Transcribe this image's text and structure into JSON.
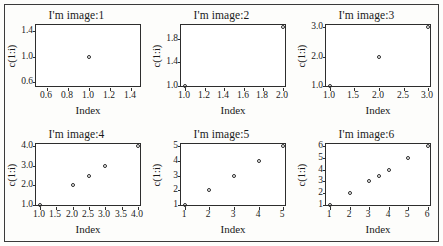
{
  "figure": {
    "background_color": "#fdfdfb",
    "border_color": "#3a3a3a",
    "axis_color": "#2d2d2d",
    "point_color": "#2b2b2b",
    "layout": "2 rows x 3 columns",
    "marker": "open-circle"
  },
  "chart_data": [
    {
      "type": "scatter",
      "title": "I'm image:1",
      "xlabel": "Index",
      "ylabel": "c(1:i)",
      "x": [
        1
      ],
      "y": [
        1
      ],
      "xlim": [
        0.5,
        1.5
      ],
      "ylim": [
        0.5,
        1.5
      ],
      "xticks": [
        "0.6",
        "0.8",
        "1.0",
        "1.2",
        "1.4"
      ],
      "xtick_values": [
        0.6,
        0.8,
        1.0,
        1.2,
        1.4
      ],
      "yticks": [
        "0.6",
        "1.0",
        "1.4"
      ],
      "ytick_values": [
        0.6,
        1.0,
        1.4
      ],
      "grid": false,
      "legend": "none"
    },
    {
      "type": "scatter",
      "title": "I'm image:2",
      "xlabel": "Index",
      "ylabel": "c(1:i)",
      "x": [
        1,
        2
      ],
      "y": [
        1,
        2
      ],
      "xlim": [
        0.96,
        2.04
      ],
      "ylim": [
        0.96,
        2.04
      ],
      "xticks": [
        "1.0",
        "1.2",
        "1.4",
        "1.6",
        "1.8",
        "2.0"
      ],
      "xtick_values": [
        1.0,
        1.2,
        1.4,
        1.6,
        1.8,
        2.0
      ],
      "yticks": [
        "1.0",
        "1.4",
        "1.8"
      ],
      "ytick_values": [
        1.0,
        1.4,
        1.8
      ],
      "grid": false,
      "legend": "none"
    },
    {
      "type": "scatter",
      "title": "I'm image:3",
      "xlabel": "Index",
      "ylabel": "c(1:i)",
      "x": [
        1,
        2,
        3
      ],
      "y": [
        1,
        2,
        3
      ],
      "xlim": [
        0.92,
        3.08
      ],
      "ylim": [
        0.92,
        3.08
      ],
      "xticks": [
        "1.0",
        "1.5",
        "2.0",
        "2.5",
        "3.0"
      ],
      "xtick_values": [
        1.0,
        1.5,
        2.0,
        2.5,
        3.0
      ],
      "yticks": [
        "1.0",
        "2.0",
        "3.0"
      ],
      "ytick_values": [
        1.0,
        2.0,
        3.0
      ],
      "grid": false,
      "legend": "none"
    },
    {
      "type": "scatter",
      "title": "I'm image:4",
      "xlabel": "Index",
      "ylabel": "c(1:i)",
      "x": [
        1,
        2,
        2.5,
        3,
        4
      ],
      "y": [
        1,
        2,
        2.5,
        3,
        4
      ],
      "xlim": [
        0.88,
        4.12
      ],
      "ylim": [
        0.88,
        4.12
      ],
      "xticks": [
        "1.0",
        "1.5",
        "2.0",
        "2.5",
        "3.0",
        "3.5",
        "4.0"
      ],
      "xtick_values": [
        1.0,
        1.5,
        2.0,
        2.5,
        3.0,
        3.5,
        4.0
      ],
      "yticks": [
        "1.0",
        "2.0",
        "3.0",
        "4.0"
      ],
      "ytick_values": [
        1.0,
        2.0,
        3.0,
        4.0
      ],
      "grid": false,
      "legend": "none"
    },
    {
      "type": "scatter",
      "title": "I'm image:5",
      "xlabel": "Index",
      "ylabel": "c(1:i)",
      "x": [
        1,
        2,
        3,
        4,
        5
      ],
      "y": [
        1,
        2,
        3,
        4,
        5
      ],
      "xlim": [
        0.84,
        5.16
      ],
      "ylim": [
        0.84,
        5.16
      ],
      "xticks": [
        "1",
        "2",
        "3",
        "4",
        "5"
      ],
      "xtick_values": [
        1,
        2,
        3,
        4,
        5
      ],
      "yticks": [
        "1",
        "2",
        "3",
        "4",
        "5"
      ],
      "ytick_values": [
        1,
        2,
        3,
        4,
        5
      ],
      "grid": false,
      "legend": "none"
    },
    {
      "type": "scatter",
      "title": "I'm image:6",
      "xlabel": "Index",
      "ylabel": "c(1:i)",
      "x": [
        1,
        2,
        3,
        3.5,
        4,
        5,
        6
      ],
      "y": [
        1,
        2,
        3,
        3.5,
        4,
        5,
        6
      ],
      "xlim": [
        0.8,
        6.2
      ],
      "ylim": [
        0.8,
        6.2
      ],
      "xticks": [
        "1",
        "2",
        "3",
        "4",
        "5",
        "6"
      ],
      "xtick_values": [
        1,
        2,
        3,
        4,
        5,
        6
      ],
      "yticks": [
        "1",
        "2",
        "3",
        "4",
        "5",
        "6"
      ],
      "ytick_values": [
        1,
        2,
        3,
        4,
        5,
        6
      ],
      "grid": false,
      "legend": "none"
    }
  ]
}
